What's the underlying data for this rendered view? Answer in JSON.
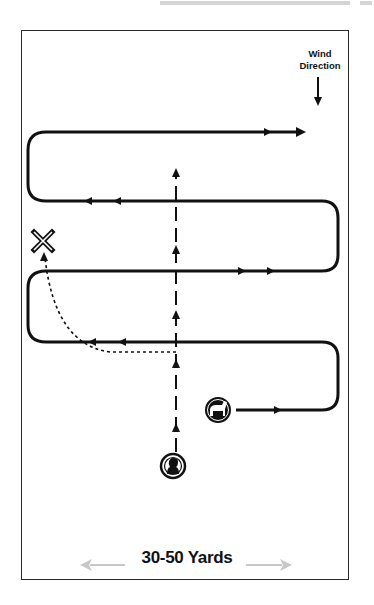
{
  "diagram": {
    "title": "",
    "wind": {
      "line1": "Wind",
      "line2": "Direction",
      "icon": "arrow-down-icon"
    },
    "width_label": "30-50 Yards",
    "markers": {
      "fall": {
        "label": "X",
        "icon": "x-mark-icon"
      },
      "dog": {
        "icon": "dog-icon"
      },
      "handler": {
        "icon": "handler-head-icon"
      }
    },
    "paths": {
      "dog_quartering": "solid line with arrows, zig-zag from dog across field upwind",
      "handler_walk": "dashed line with arrows, straight upwind",
      "retrieve_to_mark": "dotted curve to X"
    },
    "colors": {
      "line": "#111111",
      "frame": "#2a2a2a",
      "dimension_arrow": "#c8c8c8"
    }
  }
}
